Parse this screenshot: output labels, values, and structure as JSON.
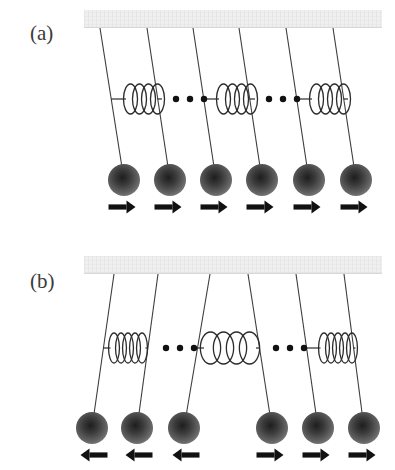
{
  "figure": {
    "background_color": "#ffffff",
    "width": 395,
    "height": 470,
    "ceiling_color": "#ededed",
    "ceiling_hatch_color": "#d8d8d8",
    "string_color": "#3d3d3d",
    "spring_color": "#2b2b2b",
    "ball_center_color": "#262626",
    "ball_edge_color": "#707070",
    "arrow_color": "#111111",
    "dot_color": "#111111"
  },
  "panels": [
    {
      "id": "panel-a",
      "label": "(a)",
      "label_x": 30,
      "label_y": 40,
      "mode_name": "in-phase mode",
      "ceiling": {
        "x": 84,
        "y": 10,
        "width": 298,
        "height": 18
      },
      "ball_row_y": 180,
      "ball_radius": 16,
      "arrow_y": 207,
      "spring_y": 99,
      "pendulums": [
        {
          "index": 1,
          "anchor_x": 100,
          "bob_x": 124,
          "arrow_direction": "right"
        },
        {
          "index": 2,
          "anchor_x": 147,
          "bob_x": 170,
          "arrow_direction": "right"
        },
        {
          "index": 3,
          "anchor_x": 193,
          "bob_x": 216,
          "arrow_direction": "right"
        },
        {
          "index": 4,
          "anchor_x": 239,
          "bob_x": 262,
          "arrow_direction": "right"
        },
        {
          "index": 5,
          "anchor_x": 286,
          "bob_x": 309,
          "arrow_direction": "right"
        },
        {
          "index": 6,
          "anchor_x": 333,
          "bob_x": 356,
          "arrow_direction": "right"
        }
      ],
      "springs": [
        {
          "index": 1,
          "left_pendulum": 1,
          "right_pendulum": 2,
          "state": "neutral",
          "coils": 4,
          "center_x": 144,
          "coil_width": 9,
          "span": 36
        },
        {
          "index": 2,
          "left_pendulum": 3,
          "right_pendulum": 4,
          "state": "neutral",
          "coils": 4,
          "center_x": 237,
          "coil_width": 9,
          "span": 36
        },
        {
          "index": 3,
          "left_pendulum": 5,
          "right_pendulum": 6,
          "state": "neutral",
          "coils": 4,
          "center_x": 330,
          "coil_width": 9,
          "span": 36
        }
      ],
      "ellipses": [
        {
          "index": 1,
          "center_x": 190,
          "dot_count": 3
        },
        {
          "index": 2,
          "center_x": 283,
          "dot_count": 3
        }
      ]
    },
    {
      "id": "panel-b",
      "label": "(b)",
      "label_x": 30,
      "label_y": 288,
      "mode_name": "out-of-phase mode",
      "ceiling": {
        "x": 84,
        "y": 256,
        "width": 298,
        "height": 18
      },
      "ball_row_y": 428,
      "ball_radius": 16,
      "arrow_y": 455,
      "spring_y": 348,
      "pendulums": [
        {
          "index": 1,
          "anchor_x": 114,
          "bob_x": 92,
          "arrow_direction": "left"
        },
        {
          "index": 2,
          "anchor_x": 158,
          "bob_x": 137,
          "arrow_direction": "left"
        },
        {
          "index": 3,
          "anchor_x": 210,
          "bob_x": 184,
          "arrow_direction": "left"
        },
        {
          "index": 4,
          "anchor_x": 248,
          "bob_x": 272,
          "arrow_direction": "right"
        },
        {
          "index": 5,
          "anchor_x": 296,
          "bob_x": 318,
          "arrow_direction": "right"
        },
        {
          "index": 6,
          "anchor_x": 344,
          "bob_x": 364,
          "arrow_direction": "right"
        }
      ],
      "springs": [
        {
          "index": 1,
          "left_pendulum": 1,
          "right_pendulum": 2,
          "state": "compressed",
          "coils": 5,
          "center_x": 128,
          "coil_width": 7,
          "span": 40
        },
        {
          "index": 2,
          "left_pendulum": 3,
          "right_pendulum": 4,
          "state": "stretched",
          "coils": 4,
          "center_x": 230,
          "coil_width": 13,
          "span": 54
        },
        {
          "index": 3,
          "left_pendulum": 5,
          "right_pendulum": 6,
          "state": "compressed",
          "coils": 5,
          "center_x": 338,
          "coil_width": 7,
          "span": 40
        }
      ],
      "ellipses": [
        {
          "index": 1,
          "center_x": 180,
          "dot_count": 3
        },
        {
          "index": 2,
          "center_x": 290,
          "dot_count": 3
        }
      ]
    }
  ]
}
